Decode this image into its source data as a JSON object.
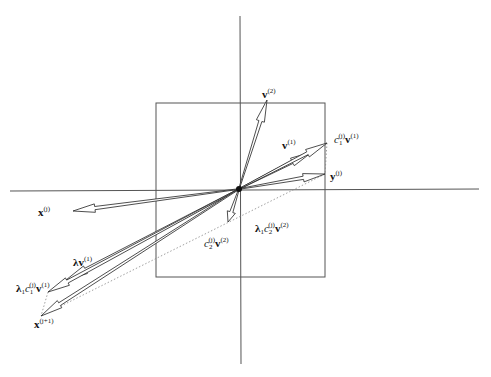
{
  "diagram": {
    "type": "vector-diagram",
    "colors": {
      "line": "#333333",
      "axis": "#555555",
      "dotted": "#888888",
      "background": "#ffffff"
    },
    "origin": [
      239,
      189
    ],
    "axes": {
      "vertical": {
        "x": 240,
        "y1": 16,
        "y2": 364
      },
      "horizontal": {
        "y": 190,
        "x1": 10,
        "x2": 479
      }
    },
    "box": {
      "x1": 156,
      "y1": 103,
      "x2": 325,
      "y2": 277
    },
    "vectors": [
      {
        "id": "v2",
        "tip": [
          267,
          100
        ]
      },
      {
        "id": "v1",
        "tip": [
          312,
          152
        ]
      },
      {
        "id": "c1v1",
        "tip": [
          327,
          143
        ]
      },
      {
        "id": "y",
        "tip": [
          325,
          174
        ]
      },
      {
        "id": "x",
        "tip": [
          73,
          211
        ]
      },
      {
        "id": "c2v2",
        "tip": [
          228,
          222
        ]
      },
      {
        "id": "lambda_v1",
        "tip": [
          66,
          280
        ]
      },
      {
        "id": "lambda1_c1_v1",
        "tip": [
          48,
          292
        ]
      },
      {
        "id": "x_next",
        "tip": [
          41,
          316
        ]
      }
    ],
    "dotted_lines": [
      {
        "from": [
          327,
          143
        ],
        "to": [
          325,
          174
        ]
      },
      {
        "from": [
          325,
          174
        ],
        "to": [
          41,
          316
        ]
      },
      {
        "from": [
          48,
          292
        ],
        "to": [
          41,
          316
        ]
      }
    ],
    "labels": {
      "v2": {
        "base": "v",
        "sup": "(2)"
      },
      "v1": {
        "base": "v",
        "sup": "(1)"
      },
      "c1v1": {
        "coef": "c",
        "coef_sub": "1",
        "coef_sup": "(j)",
        "base": "v",
        "sup": "(1)"
      },
      "y": {
        "base": "y",
        "sup": "(j)"
      },
      "x": {
        "base": "x",
        "sup": "(j)"
      },
      "c2v2": {
        "coef": "c",
        "coef_sub": "2",
        "coef_sup": "(j)",
        "base": "v",
        "sup": "(2)"
      },
      "lambda1_c2_v2": {
        "lambda": "λ",
        "lambda_sub": "1",
        "coef": "c",
        "coef_sub": "2",
        "coef_sup": "(j)",
        "base": "v",
        "sup": "(2)"
      },
      "lambda_v1": {
        "lambda": "λ",
        "base": "v",
        "sup": "(1)"
      },
      "lambda1_c1_v1": {
        "lambda": "λ",
        "lambda_sub": "1",
        "coef": "c",
        "coef_sub": "1",
        "coef_sup": "(j)",
        "base": "v",
        "sup": "(1)"
      },
      "x_next": {
        "base": "x",
        "sup": "(j+1)"
      }
    }
  }
}
